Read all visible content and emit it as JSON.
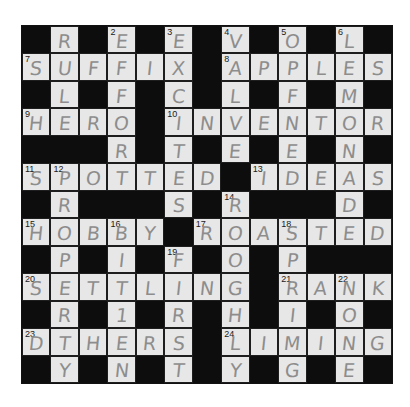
{
  "puzzle": {
    "rows": 13,
    "cols": 13,
    "colors": {
      "background": "#ffffff",
      "cell": "#e7e7e7",
      "block": "#0d0d0d",
      "pencil": "#8d8d8d",
      "number": "#1a1a1a"
    },
    "grid": [
      [
        "#",
        "R",
        "#",
        "E",
        "#",
        "E",
        "#",
        "V",
        "#",
        "O",
        "#",
        "L",
        "#"
      ],
      [
        "S",
        "U",
        "F",
        "F",
        "I",
        "X",
        "#",
        "A",
        "P",
        "P",
        "L",
        "E",
        "S"
      ],
      [
        "#",
        "L",
        "#",
        "F",
        "#",
        "C",
        "#",
        "L",
        "#",
        "F",
        "#",
        "M",
        "#"
      ],
      [
        "H",
        "E",
        "R",
        "O",
        "#",
        "I",
        "N",
        "V",
        "E",
        "N",
        "T",
        "O",
        "R"
      ],
      [
        "#",
        "#",
        "#",
        "R",
        "#",
        "T",
        "#",
        "E",
        "#",
        "E",
        "#",
        "N",
        "#"
      ],
      [
        "S",
        "P",
        "O",
        "T",
        "T",
        "E",
        "D",
        "#",
        "I",
        "D",
        "E",
        "A",
        "S"
      ],
      [
        "#",
        "R",
        "#",
        "#",
        "#",
        "S",
        "#",
        "R",
        "#",
        "#",
        "#",
        "D",
        "#"
      ],
      [
        "H",
        "O",
        "B",
        "B",
        "Y",
        "#",
        "R",
        "O",
        "A",
        "S",
        "T",
        "E",
        "D"
      ],
      [
        "#",
        "P",
        "#",
        "I",
        "#",
        "F",
        "#",
        "O",
        "#",
        "P",
        "#",
        "#",
        "#"
      ],
      [
        "S",
        "E",
        "T",
        "T",
        "L",
        "I",
        "N",
        "G",
        "#",
        "R",
        "A",
        "N",
        "K"
      ],
      [
        "#",
        "R",
        "#",
        "1",
        "#",
        "R",
        "#",
        "H",
        "#",
        "I",
        "#",
        "O",
        "#"
      ],
      [
        "D",
        "T",
        "H",
        "E",
        "R",
        "S",
        "#",
        "L",
        "I",
        "M",
        "I",
        "N",
        "G"
      ],
      [
        "#",
        "Y",
        "#",
        "N",
        "#",
        "T",
        "#",
        "Y",
        "#",
        "G",
        "#",
        "E",
        "#"
      ]
    ],
    "numbers": [
      {
        "r": 0,
        "c": 3,
        "n": "2"
      },
      {
        "r": 0,
        "c": 5,
        "n": "3"
      },
      {
        "r": 0,
        "c": 7,
        "n": "4"
      },
      {
        "r": 0,
        "c": 9,
        "n": "5"
      },
      {
        "r": 0,
        "c": 11,
        "n": "6"
      },
      {
        "r": 1,
        "c": 0,
        "n": "7"
      },
      {
        "r": 1,
        "c": 7,
        "n": "8"
      },
      {
        "r": 3,
        "c": 0,
        "n": "9"
      },
      {
        "r": 3,
        "c": 5,
        "n": "10"
      },
      {
        "r": 5,
        "c": 0,
        "n": "11"
      },
      {
        "r": 5,
        "c": 1,
        "n": "12"
      },
      {
        "r": 5,
        "c": 8,
        "n": "13"
      },
      {
        "r": 6,
        "c": 7,
        "n": "14"
      },
      {
        "r": 7,
        "c": 0,
        "n": "15"
      },
      {
        "r": 7,
        "c": 3,
        "n": "16"
      },
      {
        "r": 7,
        "c": 6,
        "n": "17"
      },
      {
        "r": 7,
        "c": 9,
        "n": "18"
      },
      {
        "r": 8,
        "c": 5,
        "n": "19"
      },
      {
        "r": 9,
        "c": 0,
        "n": "20"
      },
      {
        "r": 9,
        "c": 9,
        "n": "21"
      },
      {
        "r": 9,
        "c": 11,
        "n": "22"
      },
      {
        "r": 11,
        "c": 0,
        "n": "23"
      },
      {
        "r": 11,
        "c": 7,
        "n": "24"
      }
    ]
  }
}
